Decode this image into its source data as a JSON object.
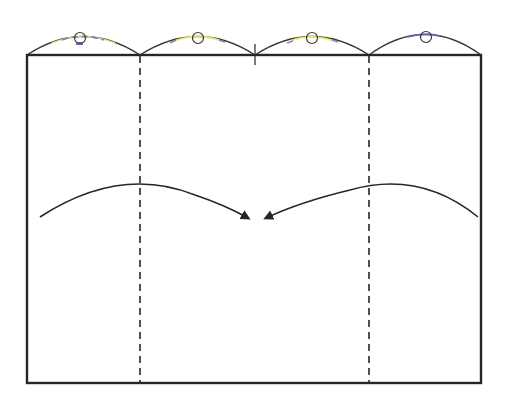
{
  "diagram": {
    "type": "folding-instruction",
    "colors": {
      "outline": "#2a2422",
      "fold_line": "#2a2422",
      "arrow": "#2a2422",
      "highlight_yellow": "#f4f07a",
      "highlight_blue": "#6a6ad0"
    },
    "rectangle": {
      "x": 27,
      "y": 55,
      "width": 454,
      "height": 328
    },
    "fold_lines": [
      {
        "name": "left-valley-fold",
        "x": 140,
        "style": "dashed"
      },
      {
        "name": "right-valley-fold",
        "x": 369,
        "style": "dashed"
      }
    ],
    "center_mark": {
      "x": 255,
      "y": 55
    },
    "top_arcs": [
      {
        "x1": 27,
        "x2": 140,
        "peak": 36,
        "circle_x": 80
      },
      {
        "x1": 140,
        "x2": 255,
        "peak": 36,
        "circle_x": 198
      },
      {
        "x1": 255,
        "x2": 369,
        "peak": 36,
        "circle_x": 312
      },
      {
        "x1": 369,
        "x2": 481,
        "peak": 33,
        "circle_x": 426
      }
    ],
    "arrows": [
      {
        "name": "left-to-center",
        "from": [
          40,
          217
        ],
        "to": [
          250,
          218
        ]
      },
      {
        "name": "right-to-center",
        "from": [
          478,
          217
        ],
        "to": [
          263,
          218
        ]
      }
    ]
  }
}
